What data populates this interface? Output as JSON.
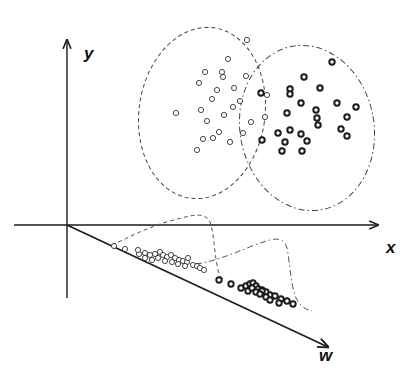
{
  "figure": {
    "axes": {
      "y_label": "y",
      "x_label": "x",
      "w_label": "w"
    },
    "colors": {
      "line": "#1a1a1a",
      "curve": "#555555",
      "background": "#ffffff"
    },
    "class_a": {
      "name": "open-circles",
      "style": "hollow thin",
      "boundary": "dashed ellipse",
      "ellipse": {
        "cx": 202,
        "cy": 113,
        "rx": 63,
        "ry": 86,
        "rotate": 8
      },
      "points": [
        [
          247,
          40
        ],
        [
          228,
          59
        ],
        [
          205,
          72
        ],
        [
          222,
          72
        ],
        [
          223,
          77
        ],
        [
          246,
          76
        ],
        [
          199,
          83
        ],
        [
          217,
          90
        ],
        [
          234,
          88
        ],
        [
          240,
          101
        ],
        [
          212,
          99
        ],
        [
          233,
          107
        ],
        [
          201,
          110
        ],
        [
          224,
          115
        ],
        [
          176,
          113
        ],
        [
          207,
          121
        ],
        [
          251,
          122
        ],
        [
          243,
          133
        ],
        [
          219,
          132
        ],
        [
          203,
          139
        ],
        [
          213,
          138
        ],
        [
          230,
          142
        ],
        [
          197,
          150
        ],
        [
          267,
          95
        ],
        [
          265,
          117
        ]
      ]
    },
    "class_b": {
      "name": "filled-ring-circles",
      "style": "thick ring",
      "boundary": "dash-dot ellipse",
      "ellipse": {
        "cx": 307,
        "cy": 128,
        "rx": 67,
        "ry": 83,
        "rotate": -10
      },
      "points": [
        [
          332,
          62
        ],
        [
          304,
          77
        ],
        [
          290,
          89
        ],
        [
          320,
          88
        ],
        [
          261,
          93
        ],
        [
          290,
          94
        ],
        [
          301,
          103
        ],
        [
          337,
          103
        ],
        [
          316,
          110
        ],
        [
          356,
          107
        ],
        [
          287,
          113
        ],
        [
          317,
          118
        ],
        [
          347,
          117
        ],
        [
          290,
          130
        ],
        [
          318,
          125
        ],
        [
          301,
          134
        ],
        [
          278,
          133
        ],
        [
          341,
          129
        ],
        [
          285,
          142
        ],
        [
          307,
          141
        ],
        [
          347,
          136
        ],
        [
          302,
          151
        ],
        [
          262,
          140
        ],
        [
          282,
          151
        ]
      ]
    },
    "projections": {
      "axis_origin": [
        67,
        225
      ],
      "axis_end": [
        330,
        348
      ],
      "class_a_projected": [
        [
          114,
          246
        ],
        [
          125,
          249
        ],
        [
          139,
          254
        ],
        [
          145,
          253
        ],
        [
          150,
          255
        ],
        [
          155,
          254
        ],
        [
          160,
          252
        ],
        [
          163,
          255
        ],
        [
          167,
          257
        ],
        [
          171,
          255
        ],
        [
          175,
          258
        ],
        [
          179,
          260
        ],
        [
          183,
          261
        ],
        [
          187,
          262
        ],
        [
          188,
          258
        ],
        [
          193,
          265
        ],
        [
          197,
          266
        ],
        [
          200,
          268
        ],
        [
          204,
          270
        ],
        [
          138,
          250
        ],
        [
          145,
          258
        ],
        [
          152,
          260
        ],
        [
          158,
          258
        ],
        [
          165,
          261
        ],
        [
          172,
          262
        ],
        [
          178,
          264
        ],
        [
          185,
          266
        ]
      ],
      "class_b_projected": [
        [
          219,
          280
        ],
        [
          231,
          284
        ],
        [
          241,
          288
        ],
        [
          246,
          286
        ],
        [
          250,
          284
        ],
        [
          253,
          283
        ],
        [
          256,
          286
        ],
        [
          258,
          289
        ],
        [
          262,
          290
        ],
        [
          266,
          292
        ],
        [
          270,
          295
        ],
        [
          275,
          296
        ],
        [
          281,
          299
        ],
        [
          287,
          301
        ],
        [
          293,
          304
        ],
        [
          279,
          303
        ],
        [
          262,
          291
        ],
        [
          248,
          291
        ],
        [
          252,
          288
        ],
        [
          256,
          292
        ],
        [
          260,
          294
        ],
        [
          266,
          297
        ],
        [
          270,
          300
        ]
      ],
      "class_a_density_curve": "M112,245 C128,238 145,228 170,221 C195,214 205,212 210,222 C214,232 214,252 218,270 C220,278 224,280 226,280",
      "class_b_density_curve": "M196,264 C212,262 230,255 252,246 C272,239 282,234 287,248 C290,262 290,282 296,298 C300,306 306,310 312,311"
    }
  }
}
